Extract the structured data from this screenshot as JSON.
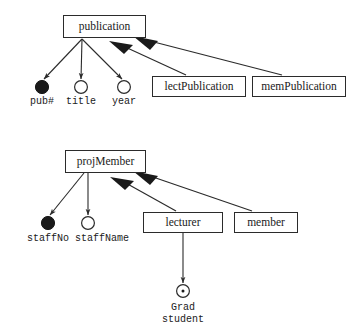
{
  "diagram": {
    "type": "entity-relationship-generalization-diagram",
    "background_color": "#ffffff",
    "line_color": "#2b2b2b",
    "text_color": "#1a1a1a",
    "clusters": [
      {
        "name": "publication-cluster",
        "superclass": "publication",
        "subclasses": [
          "lectPublication",
          "memPublication"
        ],
        "attributes": [
          "pub#",
          "title",
          "year"
        ]
      },
      {
        "name": "projmember-cluster",
        "superclass": "projMember",
        "subclasses": [
          "lecturer",
          "member"
        ],
        "attributes": [
          "staffNo",
          "staffName"
        ],
        "nested": {
          "parent": "lecturer",
          "attribute": "Grad student"
        }
      }
    ],
    "entities": {
      "publication": "publication",
      "lect_publication": "lectPublication",
      "mem_publication": "memPublication",
      "proj_member": "projMember",
      "lecturer": "lecturer",
      "member": "member"
    },
    "attributes": {
      "pub_number": "pub#",
      "title": "title",
      "year": "year",
      "staff_no": "staffNo",
      "staff_name": "staffName",
      "grad_student_line1": "Grad",
      "grad_student_line2": "student",
      "grad_student": "Grad student"
    },
    "notation": {
      "filled_circle": "key / identifying attribute",
      "open_circle": "regular attribute",
      "dotted_circle": "derived or multivalued attribute",
      "solid_triangle_arrow": "is-a / generalization link"
    }
  }
}
